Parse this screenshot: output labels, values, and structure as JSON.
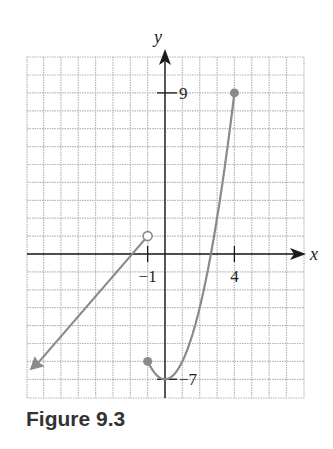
{
  "figure": {
    "caption": "Figure 9.3"
  },
  "chart_data": {
    "type": "line",
    "title": "",
    "xlabel": "x",
    "ylabel": "y",
    "xlim": [
      -8,
      8
    ],
    "ylim": [
      -8,
      11
    ],
    "grid": true,
    "x_tick_labels": [
      {
        "value": -1,
        "label": "−1"
      },
      {
        "value": 4,
        "label": "4"
      }
    ],
    "y_tick_labels": [
      {
        "value": 9,
        "label": "9"
      },
      {
        "value": -7,
        "label": "−7"
      }
    ],
    "series": [
      {
        "name": "linear piece",
        "description": "line for x < -1, open circle at (-1, 1), arrow extending down-left",
        "points": [
          [
            -1,
            1
          ],
          [
            -7.8,
            -6.5
          ]
        ],
        "start_marker": "open",
        "end_marker": "arrow"
      },
      {
        "name": "quadratic piece",
        "description": "y = x^2 - 7 for -1 <= x <= 4, closed endpoints",
        "points": [
          [
            -1,
            -6
          ],
          [
            -0.5,
            -6.75
          ],
          [
            0,
            -7
          ],
          [
            0.5,
            -6.75
          ],
          [
            1,
            -6
          ],
          [
            1.5,
            -4.75
          ],
          [
            2,
            -3
          ],
          [
            2.5,
            -0.75
          ],
          [
            3,
            2
          ],
          [
            3.5,
            5.25
          ],
          [
            4,
            9
          ]
        ],
        "start_marker": "closed",
        "end_marker": "closed"
      }
    ],
    "colors": {
      "curve": "#8a8a8a",
      "axes": "#1a1a1a",
      "grid": "#b5b5b5"
    }
  }
}
